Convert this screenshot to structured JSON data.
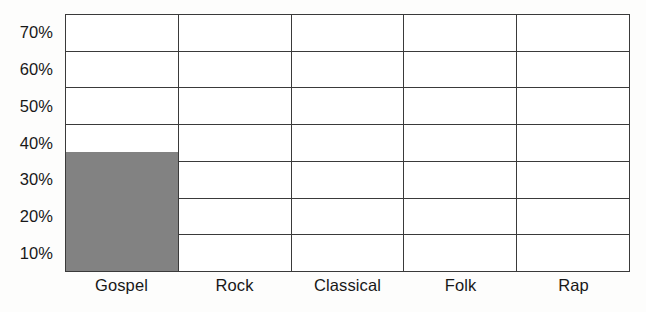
{
  "chart_data": {
    "type": "bar",
    "title": "",
    "subtitle": "",
    "xlabel": "",
    "ylabel": "",
    "categories": [
      "Gospel",
      "Rock",
      "Classical",
      "Folk",
      "Rap"
    ],
    "values": [
      35,
      0,
      0,
      0,
      0
    ],
    "series": [
      {
        "name": "Percent of respondents",
        "values": [
          35,
          0,
          0,
          0,
          0
        ]
      }
    ],
    "ytick_labels": [
      "70%",
      "60%",
      "50%",
      "40%",
      "30%",
      "20%",
      "10%"
    ],
    "ytick_values": [
      70,
      60,
      50,
      40,
      30,
      20,
      10
    ],
    "ylim": [
      0,
      75
    ],
    "gridline_values": [
      5,
      15,
      25,
      35,
      45,
      55,
      65,
      75
    ],
    "grid": true,
    "grid_orientation": "both",
    "legend": false,
    "legend_position": "none",
    "annotations": [],
    "bar_color": "#828282",
    "axis_color": "#3a3a3a",
    "plot_background": "#ffffff",
    "figure_background": "#fdfdfc",
    "text_color": "#181818",
    "note": "Tick labels are centered within each horizontal band rather than on the gridlines; each band spans 10 percentage points."
  },
  "axes": {
    "y_ticks": [
      {
        "label": "70%"
      },
      {
        "label": "60%"
      },
      {
        "label": "50%"
      },
      {
        "label": "40%"
      },
      {
        "label": "30%"
      },
      {
        "label": "20%"
      },
      {
        "label": "10%"
      }
    ],
    "x_ticks": [
      {
        "label": "Gospel"
      },
      {
        "label": "Rock"
      },
      {
        "label": "Classical"
      },
      {
        "label": "Folk"
      },
      {
        "label": "Rap"
      }
    ]
  },
  "bars": [
    {
      "category": "Gospel",
      "value": 35,
      "bands_filled": 3.5
    },
    {
      "category": "Rock",
      "value": 0,
      "bands_filled": 0
    },
    {
      "category": "Classical",
      "value": 0,
      "bands_filled": 0
    },
    {
      "category": "Folk",
      "value": 0,
      "bands_filled": 0
    },
    {
      "category": "Rap",
      "value": 0,
      "bands_filled": 0
    }
  ]
}
